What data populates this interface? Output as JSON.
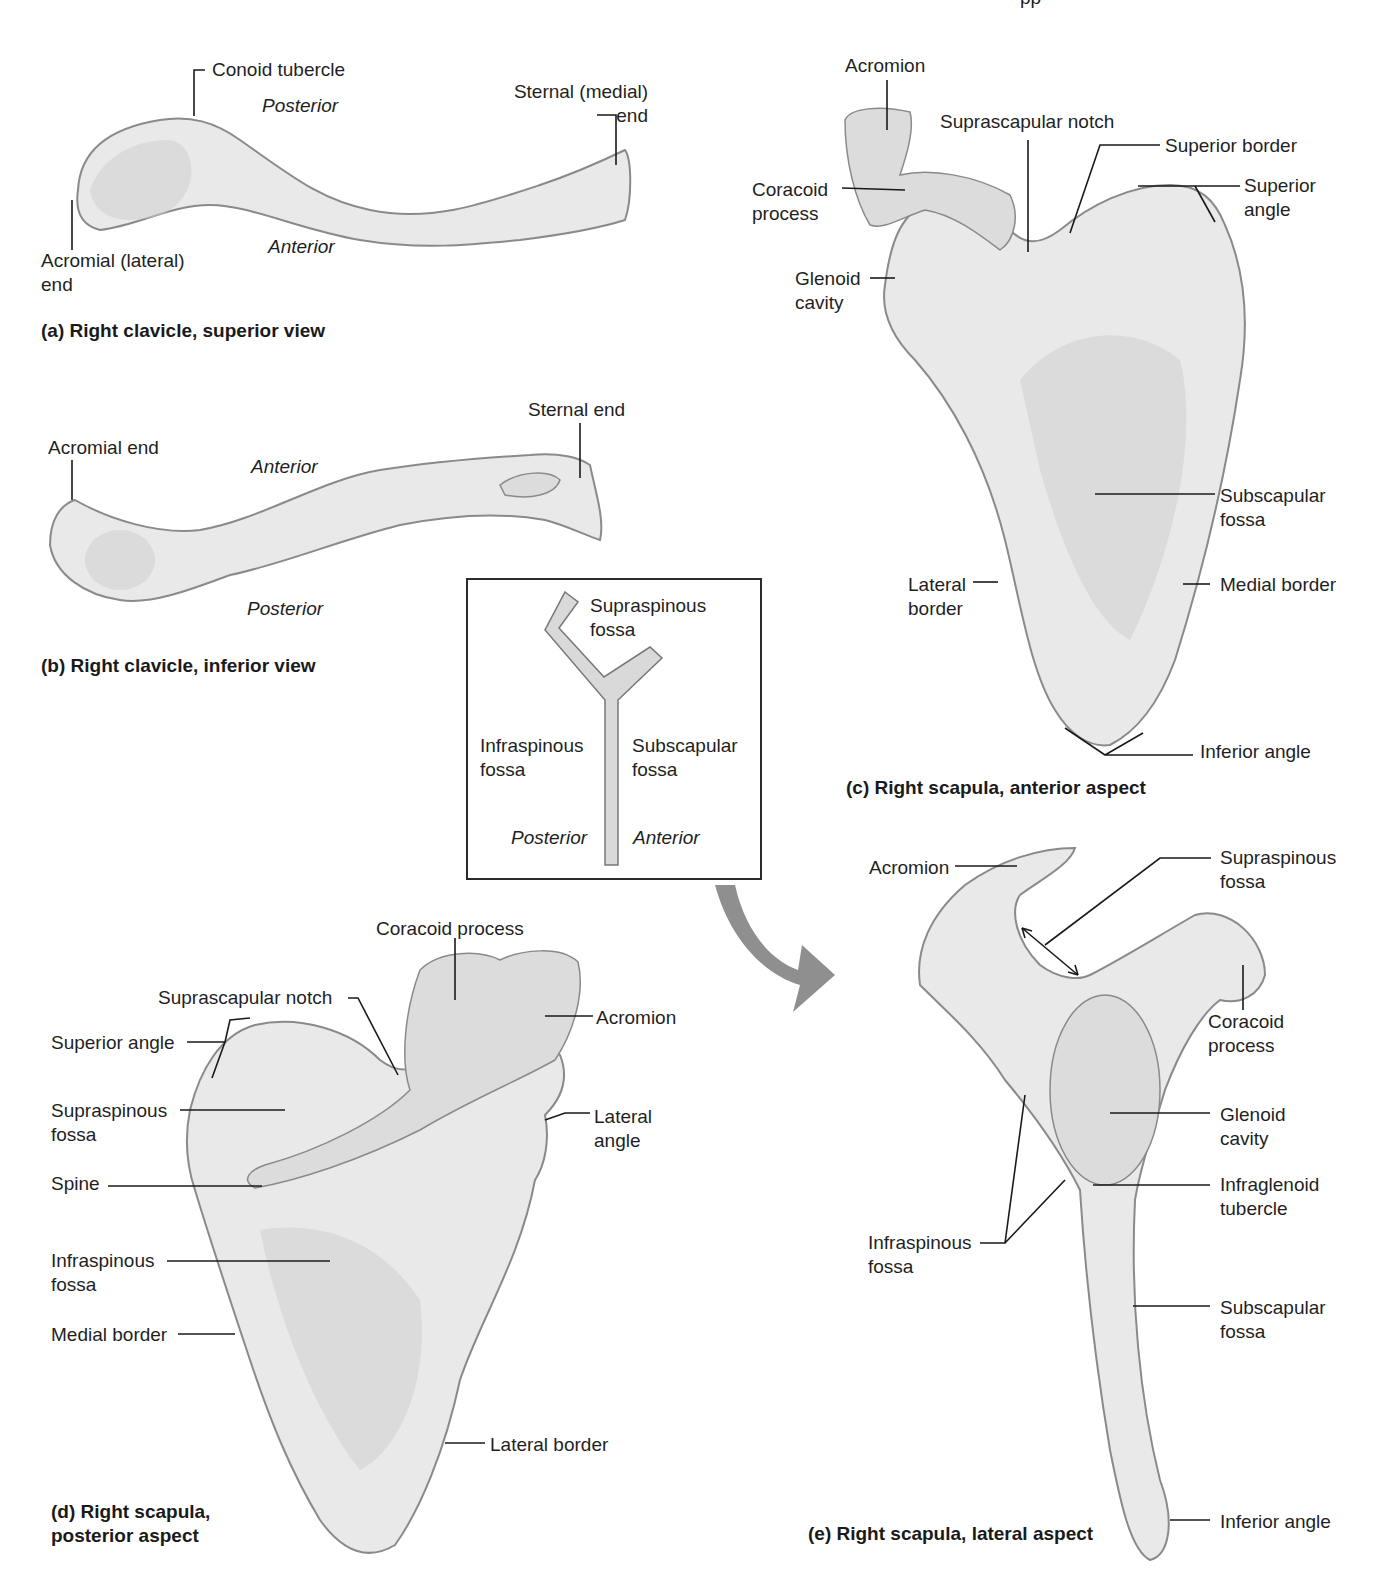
{
  "header": {
    "partial_text": "pp"
  },
  "panel_a": {
    "caption": "(a)  Right clavicle, superior view",
    "labels": {
      "conoid_tubercle": "Conoid tubercle",
      "posterior": "Posterior",
      "sternal_end": "Sternal (medial)\nend",
      "anterior": "Anterior",
      "acromial_end": "Acromial (lateral)\nend"
    }
  },
  "panel_b": {
    "caption": "(b)  Right clavicle, inferior view",
    "labels": {
      "acromial_end": "Acromial end",
      "anterior": "Anterior",
      "sternal_end": "Sternal end",
      "posterior": "Posterior"
    }
  },
  "panel_c": {
    "caption": "(c)  Right scapula, anterior aspect",
    "labels": {
      "acromion": "Acromion",
      "suprascapular_notch": "Suprascapular notch",
      "superior_border": "Superior border",
      "coracoid_process": "Coracoid\nprocess",
      "superior_angle": "Superior\nangle",
      "glenoid_cavity": "Glenoid\ncavity",
      "subscapular_fossa": "Subscapular\nfossa",
      "lateral_border": "Lateral\nborder",
      "medial_border": "Medial border",
      "inferior_angle": "Inferior angle"
    }
  },
  "inset": {
    "supraspinous": "Supraspinous\nfossa",
    "infraspinous": "Infraspinous\nfossa",
    "subscapular": "Subscapular\nfossa",
    "posterior": "Posterior",
    "anterior": "Anterior"
  },
  "panel_d": {
    "caption": "(d)  Right scapula,\n       posterior aspect",
    "labels": {
      "coracoid_process": "Coracoid process",
      "suprascapular_notch": "Suprascapular notch",
      "acromion": "Acromion",
      "superior_angle": "Superior angle",
      "supraspinous_fossa": "Supraspinous\nfossa",
      "lateral_angle": "Lateral\nangle",
      "spine": "Spine",
      "infraspinous_fossa": "Infraspinous\nfossa",
      "medial_border": "Medial border",
      "lateral_border": "Lateral border"
    }
  },
  "panel_e": {
    "caption": "(e)  Right scapula, lateral aspect",
    "labels": {
      "acromion": "Acromion",
      "supraspinous_fossa": "Supraspinous\nfossa",
      "coracoid_process": "Coracoid\nprocess",
      "glenoid_cavity": "Glenoid\ncavity",
      "infraglenoid_tubercle": "Infraglenoid\ntubercle",
      "infraspinous_fossa": "Infraspinous\nfossa",
      "subscapular_fossa": "Subscapular\nfossa",
      "inferior_angle": "Inferior angle"
    }
  }
}
